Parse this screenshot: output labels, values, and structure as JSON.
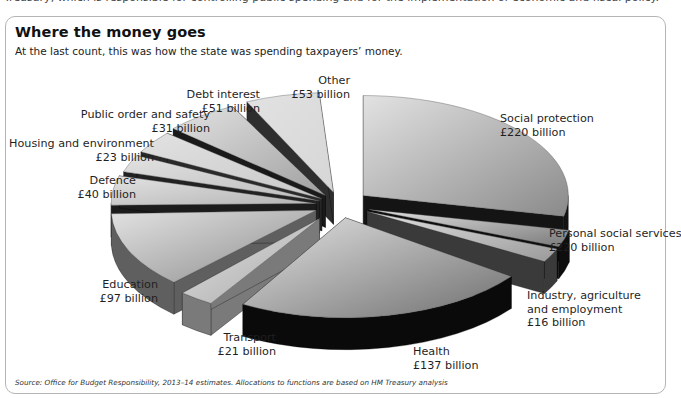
{
  "page": {
    "clipped_top_text": "Treasury, which is responsible for controlling public spending and for the implementation of economic and fiscal policy."
  },
  "figure": {
    "title": "Where the money goes",
    "subtitle": "At the last count, this was how the state was spending taxpayers’ money.",
    "source": "Source: Office for Budget Responsibility, 2013–14 estimates. Allocations to functions are based on HM Treasury analysis"
  },
  "chart_data": {
    "type": "pie",
    "style": "3d-exploded",
    "title": "Where the money goes",
    "subtitle": "At the last count, this was how the state was spending taxpayers’ money.",
    "unit": "£ billion",
    "categories": [
      "Social protection",
      "Personal social services",
      "Industry, agriculture and employment",
      "Health",
      "Transport",
      "Education",
      "Defence",
      "Housing and environment",
      "Public order and safety",
      "Debt interest",
      "Other"
    ],
    "values": [
      220,
      220,
      16,
      137,
      21,
      97,
      40,
      23,
      31,
      51,
      53
    ],
    "value_labels": [
      "£220 billion",
      "£220 billion",
      "£16 billion",
      "£137 billion",
      "£21 billion",
      "£97 billion",
      "£40 billion",
      "£23 billion",
      "£31 billion",
      "£51 billion",
      "£53 billion"
    ],
    "legend": "none (direct labels)",
    "source": "Source: Office for Budget Responsibility, 2013–14 estimates. Allocations to functions are based on HM Treasury analysis"
  },
  "render": {
    "cx": 340,
    "cy": 205,
    "rx": 205,
    "ry": 100,
    "depth": 32,
    "slices": [
      {
        "name": "Social protection",
        "start": -90,
        "end": 12,
        "explode": 30,
        "top": "#8a8a8a",
        "side": "#141414"
      },
      {
        "name": "Personal social services",
        "start": 12,
        "end": 22,
        "explode": 30,
        "top": "#7a7a7a",
        "side": "#0e0e0e"
      },
      {
        "name": "Industry",
        "start": 22,
        "end": 30,
        "explode": 30,
        "top": "#9a9a9a",
        "side": "#3a3a3a"
      },
      {
        "name": "Health",
        "start": 36,
        "end": 120,
        "explode": 26,
        "top": "#6f6f6f",
        "side": "#0a0a0a"
      },
      {
        "name": "Transport",
        "start": 122,
        "end": 132,
        "explode": 34,
        "top": "#a8a8a8",
        "side": "#7a7a7a"
      },
      {
        "name": "Education",
        "start": 134,
        "end": 178,
        "explode": 26,
        "top": "#8c8c8c",
        "side": "#5f5f5f"
      },
      {
        "name": "Defence",
        "start": 179,
        "end": 196,
        "explode": 24,
        "top": "#b4b4b4",
        "side": "#1c1c1c"
      },
      {
        "name": "Housing",
        "start": 197,
        "end": 207,
        "explode": 22,
        "top": "#bcbcbc",
        "side": "#222222"
      },
      {
        "name": "Public order",
        "start": 208,
        "end": 221,
        "explode": 22,
        "top": "#c8c8c8",
        "side": "#2a2a2a"
      },
      {
        "name": "Debt interest",
        "start": 222,
        "end": 243,
        "explode": 24,
        "top": "#a0a0a0",
        "side": "#1a1a1a"
      },
      {
        "name": "Other",
        "start": 245,
        "end": 266,
        "explode": 26,
        "top": "#d6d6d6",
        "side": "#2e2e2e"
      }
    ]
  },
  "labels": [
    {
      "key": "social_protection",
      "lines": [
        "Social protection",
        "£220 billion"
      ],
      "x": 500,
      "y": 112,
      "align": "l"
    },
    {
      "key": "personal_social",
      "lines": [
        "Personal social services",
        "£220 billion"
      ],
      "x": 549,
      "y": 227,
      "align": "l"
    },
    {
      "key": "industry",
      "lines": [
        "Industry, agriculture",
        "and employment",
        "£16 billion"
      ],
      "x": 527,
      "y": 289,
      "align": "l"
    },
    {
      "key": "health",
      "lines": [
        "Health",
        "£137 billion"
      ],
      "x": 413,
      "y": 345,
      "align": "l"
    },
    {
      "key": "transport",
      "lines": [
        "Transport",
        "£21 billion"
      ],
      "x": 186,
      "y": 331,
      "align": "r",
      "w": 90
    },
    {
      "key": "education",
      "lines": [
        "Education",
        "£97 billion"
      ],
      "x": 68,
      "y": 278,
      "align": "r",
      "w": 90
    },
    {
      "key": "defence",
      "lines": [
        "Defence",
        "£40 billion"
      ],
      "x": 40,
      "y": 174,
      "align": "r",
      "w": 96
    },
    {
      "key": "housing",
      "lines": [
        "Housing and environment",
        "£23 billion"
      ],
      "x": 2,
      "y": 137,
      "align": "r",
      "w": 152
    },
    {
      "key": "public_order",
      "lines": [
        "Public order and safety",
        "£31 billion"
      ],
      "x": 60,
      "y": 108,
      "align": "r",
      "w": 150
    },
    {
      "key": "debt_interest",
      "lines": [
        "Debt interest",
        "£51 billion"
      ],
      "x": 170,
      "y": 88,
      "align": "r",
      "w": 90
    },
    {
      "key": "other",
      "lines": [
        "Other",
        "£53 billion"
      ],
      "x": 260,
      "y": 74,
      "align": "r",
      "w": 90
    }
  ]
}
